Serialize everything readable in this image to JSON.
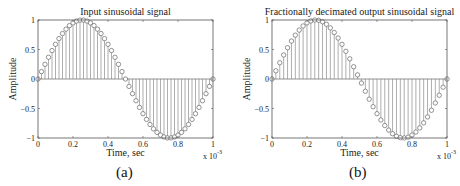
{
  "chart_data": [
    {
      "type": "stem",
      "panel": "a",
      "title": "Input sinusoidal signal",
      "xlabel": "Time, sec",
      "ylabel": "Amplitude",
      "x_multiplier": "x 10",
      "x_multiplier_exp": "-3",
      "xlim": [
        0,
        1
      ],
      "ylim": [
        -1,
        1
      ],
      "xticks": [
        "0",
        "0.2",
        "0.4",
        "0.6",
        "0.8",
        "1"
      ],
      "yticks": [
        "-1",
        "-0.5",
        "0",
        "0.5",
        "1"
      ],
      "signal": "sin(2*pi*t) over one period, t in [0,1] x 1e-3 s",
      "num_samples": 51,
      "sample_step": 0.02,
      "grid": false,
      "marker": "circle"
    },
    {
      "type": "stem",
      "panel": "b",
      "title": "Fractionally decimated output sinusoidal signal",
      "xlabel": "Time, sec",
      "ylabel": "Amplitude",
      "x_multiplier": "x 10",
      "x_multiplier_exp": "-3",
      "xlim": [
        0,
        1
      ],
      "ylim": [
        -1,
        1
      ],
      "xticks": [
        "0",
        "0.2",
        "0.4",
        "0.6",
        "0.8",
        "1"
      ],
      "yticks": [
        "-1",
        "-0.5",
        "0",
        "0.5",
        "1"
      ],
      "signal": "sin(2*pi*t) over one period, t in [0,1] x 1e-3 s",
      "num_samples": 46,
      "sample_step": 0.0222,
      "grid": false,
      "marker": "circle"
    }
  ],
  "captions": {
    "a": "(a)",
    "b": "(b)"
  },
  "colors": {
    "axes": "#555555",
    "stem": "#777777",
    "marker": "#666666",
    "text": "#222222"
  }
}
